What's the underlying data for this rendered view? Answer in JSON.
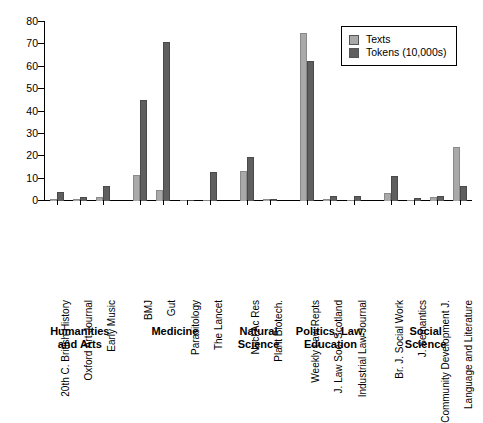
{
  "chart_data": {
    "type": "bar",
    "title": "",
    "subtitle": "",
    "xlabel": "",
    "ylabel": "",
    "ylim": [
      0,
      80
    ],
    "yticks": [
      0,
      10,
      20,
      30,
      40,
      50,
      60,
      70,
      80
    ],
    "grid": false,
    "legend_position": "top-right",
    "categories": [
      "20th C. British History",
      "Oxford Art Journal",
      "Early Music",
      "BMJ",
      "Gut",
      "Parasitology",
      "The Lancet",
      "Nucl Ac Res",
      "Plant Biotech.",
      "Weekly Law Repts",
      "J. Law Soc. Scotland",
      "Industrial Law Journal",
      "Br. J. Social Work",
      "J. Semantics",
      "Community Development J.",
      "Language and Literature"
    ],
    "series": [
      {
        "name": "Texts",
        "color": "#a9a9a9",
        "values": [
          0.7,
          0.8,
          1.6,
          11.8,
          4.8,
          0.3,
          0.6,
          13.4,
          0.7,
          75.0,
          0.8,
          0.6,
          3.8,
          0.5,
          1.9,
          24.0
        ]
      },
      {
        "name": "Tokens (10,000s)",
        "color": "#5f5f5f",
        "values": [
          4.2,
          2.0,
          6.8,
          45.0,
          71.0,
          0.4,
          12.8,
          19.8,
          0.9,
          62.5,
          2.4,
          2.1,
          11.0,
          1.3,
          2.3,
          6.5
        ]
      }
    ],
    "sections": [
      {
        "label": "Humanities\nand Arts",
        "line1": "Humanities",
        "line2": "and Arts",
        "count": 3
      },
      {
        "label": "Medicine",
        "line1": "Medicine",
        "line2": "",
        "count": 4
      },
      {
        "label": "Natural\nScience",
        "line1": "Natural",
        "line2": "Science",
        "count": 2
      },
      {
        "label": "Politics, Law,\nEducation",
        "line1": "Politics, Law,",
        "line2": "Education",
        "count": 3
      },
      {
        "label": "Social\nScience",
        "line1": "Social",
        "line2": "Science",
        "count": 4
      }
    ]
  },
  "legend": {
    "items": [
      {
        "label": "Texts",
        "color": "#a9a9a9"
      },
      {
        "label": "Tokens (10,000s)",
        "color": "#5f5f5f"
      }
    ]
  }
}
